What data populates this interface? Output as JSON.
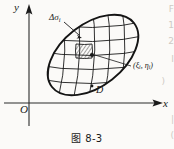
{
  "figure": {
    "caption": "图 8-3",
    "axes": {
      "y_label": "y",
      "x_label": "x",
      "origin_label": "O",
      "x_axis_y": 103,
      "y_axis_x": 29,
      "arrow_style": "solid-triangle"
    },
    "region": {
      "name_label": "D",
      "shape": "tilted-ellipse",
      "center": [
        93,
        55
      ],
      "semi_major": 52,
      "semi_minor": 31,
      "rotation_deg": -38,
      "grid": "curvilinear",
      "grid_rows": 6,
      "grid_cols": 6
    },
    "annotations": {
      "subregion_label": "Δσ",
      "subregion_sub": "i",
      "subregion_leader": "arrow pointing to hatched cell",
      "point_label_open": "(ξ",
      "point_label_sub1": "i",
      "point_label_mid": ", η",
      "point_label_sub2": "i",
      "point_label_close": ")",
      "point_leader": "line from label to dot inside hatched cell",
      "hatched_cell": "shaded sample subregion",
      "sample_point_marker": "filled dot"
    },
    "colors": {
      "ink": "#1a1a1a",
      "paper": "#fbfaf8",
      "axis": "#2b2b2b",
      "bleed": "#cfcac4"
    },
    "side_bleed": [
      "F",
      "1",
      "2",
      "I",
      ")",
      "x",
      "|",
      "("
    ]
  }
}
